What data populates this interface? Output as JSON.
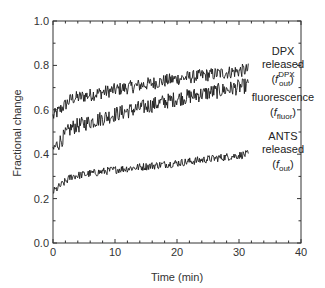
{
  "chart_data": {
    "type": "line",
    "title": "",
    "xlabel": "Time (min)",
    "ylabel": "Fractional change",
    "xlim": [
      0,
      40
    ],
    "ylim": [
      0.0,
      1.0
    ],
    "xticks": [
      "0",
      "10",
      "20",
      "30",
      "40"
    ],
    "yticks": [
      "0.0",
      "0.2",
      "0.4",
      "0.6",
      "0.8",
      "1.0"
    ],
    "grid": false,
    "legend_position": "inline-right",
    "series": [
      {
        "name": "DPX released (f_out^DPX)",
        "label_lines": [
          "DPX",
          "released"
        ],
        "symbol_main": "f",
        "symbol_sub": "out",
        "symbol_sup": "DPX",
        "x_range": [
          0,
          31.5
        ],
        "trend": [
          [
            0,
            0.57
          ],
          [
            3,
            0.65
          ],
          [
            10,
            0.69
          ],
          [
            20,
            0.74
          ],
          [
            31.5,
            0.78
          ]
        ],
        "noise_amplitude": 0.03
      },
      {
        "name": "fluorescence (f_fluor)",
        "label_lines": [
          "fluorescence"
        ],
        "symbol_main": "f",
        "symbol_sub": "fluor",
        "symbol_sup": "",
        "x_range": [
          0,
          31.5
        ],
        "trend": [
          [
            0,
            0.42
          ],
          [
            3,
            0.52
          ],
          [
            10,
            0.58
          ],
          [
            20,
            0.65
          ],
          [
            31.5,
            0.71
          ]
        ],
        "noise_amplitude": 0.035
      },
      {
        "name": "ANTS released (f_out)",
        "label_lines": [
          "ANTS",
          "released"
        ],
        "symbol_main": "f",
        "symbol_sub": "out",
        "symbol_sup": "",
        "x_range": [
          0,
          31.5
        ],
        "trend": [
          [
            0,
            0.23
          ],
          [
            3,
            0.3
          ],
          [
            10,
            0.33
          ],
          [
            20,
            0.36
          ],
          [
            31.5,
            0.4
          ]
        ],
        "noise_amplitude": 0.018
      }
    ],
    "line_color": "#1a1a1a"
  }
}
